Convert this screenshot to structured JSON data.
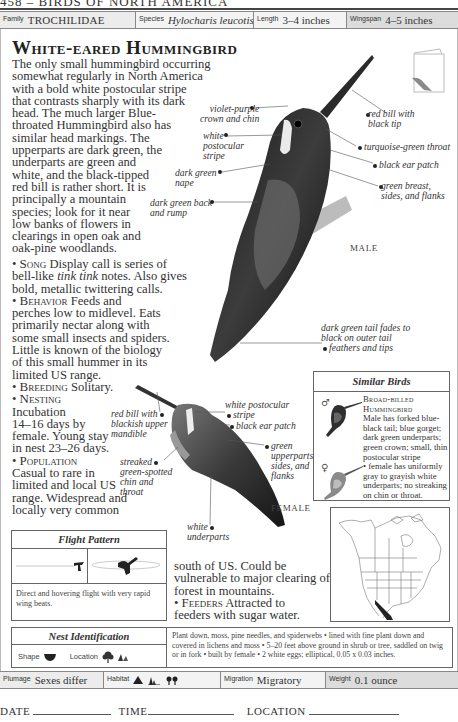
{
  "running_head": "458 – BIRDS OF NORTH AMERICA",
  "top_bar": {
    "family": {
      "label": "Family",
      "value": "TROCHILIDAE"
    },
    "species": {
      "label": "Species",
      "value": "Hylocharis leucotis"
    },
    "length": {
      "label": "Length",
      "value": "3–4 inches"
    },
    "wingspan": {
      "label": "Wingspan",
      "value": "4–5 inches"
    }
  },
  "title": "White-eared Hummingbird",
  "intro_lines": [
    "The only small hummingbird occurring",
    "somewhat regularly in North America",
    "with a bold white postocular stripe",
    "that contrasts sharply with its dark",
    "head. The much larger Blue-",
    "throated Hummingbird also has",
    "similar head markings. The",
    "upperparts are dark green, the",
    "underparts are green and",
    "white, and the black-tipped",
    "red bill is rather short. It is",
    "principally a mountain",
    "species; look for it near",
    "low banks of flowers in",
    "clearings in open oak and",
    "oak-pine woodlands."
  ],
  "sections": {
    "song": {
      "heading": "Song",
      "lines": [
        "Display call is series of",
        "bell-like",
        "tink tink",
        "notes. Also gives",
        "bold, metallic twittering calls."
      ]
    },
    "behavior": {
      "heading": "Behavior",
      "lines": [
        "Feeds and",
        "perches low to midlevel. Eats",
        "primarily nectar along with",
        "some small insects and spiders.",
        "Little is known of the biology",
        "of this small hummer in its",
        "limited US range."
      ]
    },
    "breeding": {
      "heading": "Breeding",
      "text": "Solitary."
    },
    "nesting": {
      "heading": "Nesting",
      "lines": [
        "Incubation",
        "14–16 days by",
        "female. Young stay",
        "in nest 23–26 days."
      ]
    },
    "population": {
      "heading": "Population",
      "lines": [
        "Casual to rare in",
        "limited and local US",
        "range. Widespread and",
        "locally very common"
      ],
      "continued": [
        "south of US. Could be",
        "vulnerable to major clearing of",
        "forest in mountains."
      ]
    },
    "feeders": {
      "heading": "Feeders",
      "lines": [
        "Attracted to",
        "feeders with sugar water."
      ]
    }
  },
  "male_callouts": {
    "crown": [
      "violet-purple",
      "crown and chin"
    ],
    "stripe": [
      "white",
      "postocular",
      "stripe"
    ],
    "nape": [
      "dark green",
      "nape"
    ],
    "back": [
      "dark green back",
      "and rump"
    ],
    "bill": [
      "red bill with",
      "black tip"
    ],
    "throat": "turquoise-green throat",
    "ear": "black ear patch",
    "breast": [
      "green breast,",
      "sides, and flanks"
    ],
    "tail": [
      "dark green tail fades to",
      "black on outer tail",
      "feathers and tips"
    ],
    "sex_label": "MALE"
  },
  "female_callouts": {
    "bill": [
      "red bill with",
      "blackish upper",
      "mandible"
    ],
    "stripe": [
      "white postocular",
      "stripe"
    ],
    "ear": "black ear patch",
    "upperparts": [
      "green",
      "upperparts,",
      "sides, and",
      "flanks"
    ],
    "chin": [
      "streaked",
      "green-spotted",
      "chin and",
      "throat"
    ],
    "underparts": [
      "white",
      "underparts"
    ],
    "sex_label": "FEMALE"
  },
  "similar_birds": {
    "title": "Similar Birds",
    "male_symbol": "♂",
    "female_symbol": "♀",
    "name_lines": [
      "Broad-billed",
      "Hummingbird"
    ],
    "desc_lines": [
      "Male has forked blue-",
      "black tail; blue gorget;",
      "dark green underparts;",
      "green crown; small, thin",
      "postocular stripe",
      "• female has uniformly",
      "gray to grayish white",
      "underparts; no streaking",
      "on chin or throat."
    ]
  },
  "flight_pattern": {
    "title": "Flight Pattern",
    "description": "Direct and hovering flight with very rapid wing beats."
  },
  "nest_identification": {
    "title": "Nest Identification",
    "shape_label": "Shape",
    "location_label": "Location",
    "description": "Plant down, moss, pine needles, and spiderwebs • lined with fine plant down and covered in lichens and moss • 5–20 feet above ground in shrub or tree, saddled on twig or in fork • built by female • 2 white eggs; elliptical, 0.05 x 0.03 inches."
  },
  "bottom_bar": {
    "plumage": {
      "label": "Plumage",
      "value": "Sexes differ"
    },
    "habitat": {
      "label": "Habitat",
      "icons": [
        "mountain-icon",
        "forest-edge-icon",
        "woodland-icon"
      ]
    },
    "migration": {
      "label": "Migration",
      "value": "Migratory"
    },
    "weight": {
      "label": "Weight",
      "value": "0.1 ounce"
    }
  },
  "log": {
    "date": "DATE",
    "time": "TIME",
    "location": "LOCATION"
  },
  "colors": {
    "bar_light": "#ebebeb",
    "bar_dark": "#dcdcdc",
    "border": "#666666",
    "text": "#333333",
    "range_fill": "#222222"
  }
}
